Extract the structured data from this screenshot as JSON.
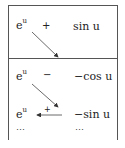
{
  "diagram": {
    "type": "tabular-integration-table",
    "top_section": {
      "rows": [
        {
          "left": "e",
          "left_exp": "u",
          "sign": "+",
          "right": "sin u"
        }
      ]
    },
    "bottom_section": {
      "rows": [
        {
          "left": "e",
          "left_exp": "u",
          "sign": "−",
          "right": "−cos u"
        },
        {
          "left": "e",
          "left_exp": "u",
          "sign": "+",
          "right": "−sin u"
        },
        {
          "left": "⋯",
          "right": "⋯"
        }
      ]
    },
    "arrows": [
      {
        "from": "e^u (top row)",
        "to": "divider",
        "direction": "diagonal-down-right"
      },
      {
        "from": "e^u (row 2)",
        "to": "row 3 right",
        "direction": "diagonal-down-right"
      },
      {
        "from": "row 3 right",
        "to": "e^u (row 3)",
        "direction": "horizontal-left"
      }
    ],
    "colors": {
      "line": "#555555",
      "text": "#222222"
    }
  }
}
